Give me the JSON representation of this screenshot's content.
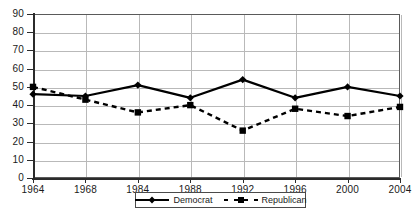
{
  "chart_data": {
    "type": "line",
    "title": "",
    "subtitle": "",
    "xlabel": "",
    "ylabel": "",
    "categories": [
      "1964",
      "1968",
      "1984",
      "1988",
      "1992",
      "1996",
      "2000",
      "2004"
    ],
    "series": [
      {
        "name": "Democrat",
        "values": [
          46,
          45,
          51,
          44,
          54,
          44,
          50,
          45
        ],
        "line_style": "solid",
        "marker": "diamond",
        "color": "#000000"
      },
      {
        "name": "Republican",
        "values": [
          50,
          43,
          36,
          40,
          26,
          38,
          34,
          39
        ],
        "line_style": "dashed",
        "marker": "square",
        "color": "#000000"
      }
    ],
    "ylim": [
      0,
      90
    ],
    "ytick_step": 10,
    "yticks": [
      "0",
      "10",
      "20",
      "30",
      "40",
      "50",
      "60",
      "70",
      "80",
      "90"
    ],
    "grid": "both",
    "legend_position": "bottom",
    "plot_background": "#ffffff",
    "grid_color": "#b9b9b9",
    "axis_color": "#2b2b2b"
  },
  "legend": {
    "items": [
      {
        "label": "Democrat"
      },
      {
        "label": "Republican"
      }
    ]
  }
}
